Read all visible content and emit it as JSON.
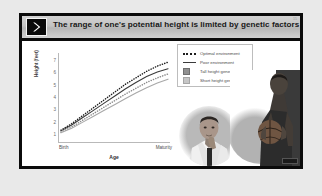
{
  "slide": {
    "title": "The range of one's potential height is limited by genetic factors",
    "page_number": "15",
    "logo_icon": "chevron-right-icon",
    "border_color": "#0b0b0b",
    "title_bar_color": "#c3c3c3",
    "background_color": "#e9e9e9"
  },
  "chart_data": {
    "type": "line",
    "title": "",
    "xlabel": "Age",
    "ylabel": "Height (feet)",
    "xtick_labels": [
      "Birth",
      "Maturity"
    ],
    "ytick_labels": [
      "1",
      "2",
      "3",
      "4",
      "5",
      "6",
      "7"
    ],
    "ylim": [
      0.6,
      7.4
    ],
    "yticks": [
      1,
      2,
      3,
      4,
      5,
      6,
      7
    ],
    "xlim": [
      0,
      1
    ],
    "grid": false,
    "legend_position": "top-right",
    "x": [
      0,
      0.1,
      0.2,
      0.3,
      0.4,
      0.5,
      0.6,
      0.7,
      0.8,
      0.9,
      1.0
    ],
    "series": [
      {
        "name": "Tall height genes, optimal environment",
        "style": "dotted",
        "color": "#1d1d1d",
        "values": [
          1.5,
          2.0,
          2.6,
          3.2,
          3.8,
          4.4,
          5.0,
          5.5,
          6.0,
          6.4,
          6.7
        ]
      },
      {
        "name": "Tall height genes, poor environment",
        "style": "solid",
        "color": "#3b3b3b",
        "values": [
          1.45,
          1.9,
          2.45,
          3.0,
          3.55,
          4.1,
          4.65,
          5.15,
          5.6,
          5.95,
          6.2
        ]
      },
      {
        "name": "Short height genes, optimal environment",
        "style": "dotted",
        "color": "#8a8a8a",
        "values": [
          1.35,
          1.75,
          2.25,
          2.75,
          3.25,
          3.75,
          4.25,
          4.7,
          5.15,
          5.5,
          5.8
        ]
      },
      {
        "name": "Short height genes, poor environment",
        "style": "solid",
        "color": "#a8a8a8",
        "values": [
          1.3,
          1.65,
          2.1,
          2.55,
          3.0,
          3.45,
          3.9,
          4.35,
          4.75,
          5.1,
          5.4
        ]
      }
    ],
    "legend": [
      {
        "label": "Optimal environment",
        "key": "dotted-line",
        "color": "#1d1d1d"
      },
      {
        "label": "Poor environment",
        "key": "solid-line",
        "color": "#3b3b3b"
      },
      {
        "label": "Tall height genes",
        "key": "swatch-dark",
        "color": "#909090"
      },
      {
        "label": "Short height genes",
        "key": "swatch-light",
        "color": "#c6c6c6"
      }
    ]
  },
  "photos": [
    {
      "name": "short-man-photo",
      "caption": ""
    },
    {
      "name": "tall-basketball-player-photo",
      "caption": ""
    }
  ]
}
